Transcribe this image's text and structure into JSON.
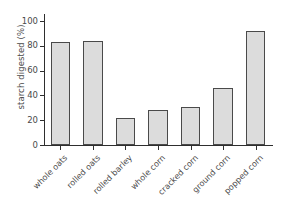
{
  "chart_data": {
    "type": "bar",
    "title": "",
    "xlabel": "",
    "ylabel": "starch digested (%)",
    "ylim": [
      0,
      100
    ],
    "yticks": [
      0,
      20,
      40,
      60,
      80,
      100
    ],
    "ytick_labels": [
      "0",
      "20",
      "40",
      "60",
      "80",
      "100"
    ],
    "grid": false,
    "legend": "none",
    "bar_fill_color": "#dcdcdc",
    "bar_edge_color": "#4a4a4a",
    "axis_color": "#2e2e2e",
    "background_color": "#ffffff",
    "categories": [
      "whole oats",
      "rolled oats",
      "rolled barley",
      "whole corn",
      "cracked corn",
      "ground corn",
      "popped corn"
    ],
    "values": [
      83,
      84,
      22,
      28,
      31,
      46,
      92
    ]
  }
}
